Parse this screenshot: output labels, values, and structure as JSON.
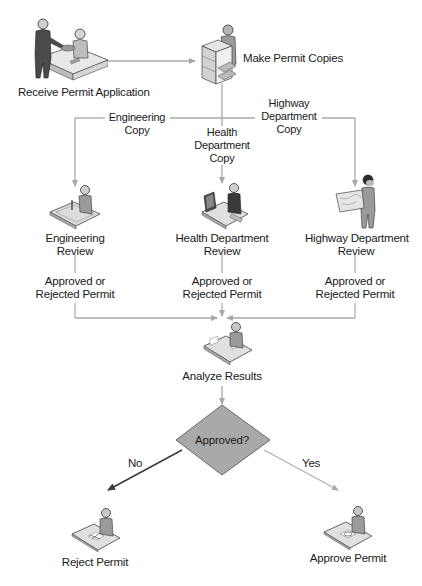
{
  "diagram": {
    "type": "flowchart",
    "header_clipped_text": "",
    "colors": {
      "connector": "#a8a8a8",
      "connector_dark": "#3a3a3a",
      "decision_fill": "#a9a9a9",
      "decision_stroke": "#6a6a6a",
      "figure_fill": "#9a9a9a",
      "figure_dark": "#4a4a4a",
      "text": "#1a1a1a"
    },
    "nodes": {
      "receive": {
        "label": "Receive Permit Application",
        "icon": "clerk-desk-icon"
      },
      "copies": {
        "label": "Make Permit Copies",
        "icon": "copier-icon"
      },
      "engineering_review": {
        "label_line1": "Engineering",
        "label_line2": "Review",
        "icon": "drafting-table-icon"
      },
      "health_review": {
        "label_line1": "Health Department",
        "label_line2": "Review",
        "icon": "computer-workstation-icon"
      },
      "highway_review": {
        "label_line1": "Highway Department",
        "label_line2": "Review",
        "icon": "surveyor-map-icon"
      },
      "analyze": {
        "label": "Analyze Results",
        "icon": "desk-worker-icon"
      },
      "decision": {
        "label": "Approved?"
      },
      "reject": {
        "label": "Reject Permit",
        "icon": "reject-desk-icon"
      },
      "approve": {
        "label": "Approve Permit",
        "icon": "approve-desk-icon"
      }
    },
    "edges": {
      "engineering_copy": {
        "line1": "Engineering",
        "line2": "Copy"
      },
      "health_copy": {
        "line1": "Health",
        "line2": "Department",
        "line3": "Copy"
      },
      "highway_copy": {
        "line1": "Highway",
        "line2": "Department",
        "line3": "Copy"
      },
      "eng_result": {
        "line1": "Approved or",
        "line2": "Rejected Permit"
      },
      "health_result": {
        "line1": "Approved or",
        "line2": "Rejected Permit"
      },
      "highway_result": {
        "line1": "Approved or",
        "line2": "Rejected Permit"
      },
      "no": {
        "label": "No"
      },
      "yes": {
        "label": "Yes"
      }
    }
  }
}
